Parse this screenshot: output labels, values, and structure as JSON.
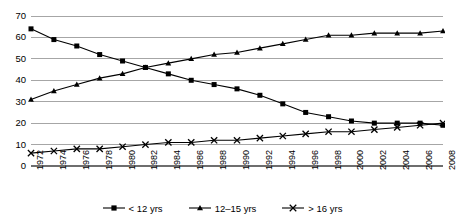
{
  "chart_data": {
    "type": "line",
    "title": "",
    "xlabel": "",
    "ylabel": "",
    "ylim": [
      0,
      70
    ],
    "ytick_step": 10,
    "grid": true,
    "legend_position": "bottom",
    "yticks": [
      "70",
      "60",
      "50",
      "40",
      "30",
      "20",
      "10",
      "0"
    ],
    "categories": [
      "1972",
      "1974",
      "1976",
      "1978",
      "1980",
      "1982",
      "1984",
      "1986",
      "1988",
      "1990",
      "1992",
      "1994",
      "1996",
      "1998",
      "2000",
      "2002",
      "2004",
      "2006",
      "2008"
    ],
    "series": [
      {
        "name": "< 12 yrs",
        "marker": "square",
        "values": [
          64,
          59,
          56,
          52,
          49,
          46,
          43,
          40,
          38,
          36,
          33,
          29,
          25,
          23,
          21,
          20,
          20,
          20,
          19
        ]
      },
      {
        "name": "12–15 yrs",
        "marker": "triangle",
        "values": [
          31,
          35,
          38,
          41,
          43,
          46,
          48,
          50,
          52,
          53,
          55,
          57,
          59,
          61,
          61,
          62,
          62,
          62,
          63
        ]
      },
      {
        "name": "> 16 yrs",
        "marker": "x",
        "values": [
          6,
          7,
          8,
          8,
          9,
          10,
          11,
          11,
          12,
          12,
          13,
          14,
          15,
          16,
          16,
          17,
          18,
          19,
          20
        ]
      }
    ]
  },
  "legend": {
    "items": [
      {
        "label": "< 12 yrs",
        "marker": "square"
      },
      {
        "label": "12–15 yrs",
        "marker": "triangle"
      },
      {
        "label": "> 16 yrs",
        "marker": "x"
      }
    ]
  },
  "colors": {
    "series": "#000000",
    "grid": "#a6a6a6",
    "axis": "#808080",
    "background": "#ffffff"
  }
}
